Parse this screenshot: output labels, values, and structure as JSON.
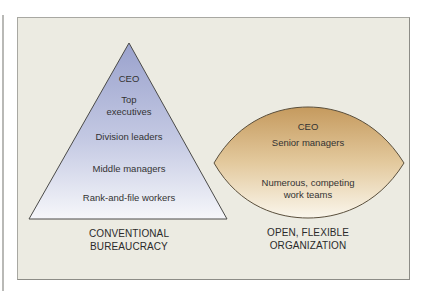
{
  "diagram": {
    "colors": {
      "panel_bg": "#ecebe2",
      "triangle_top": "#9ea6cf",
      "triangle_bottom": "#f4f5f8",
      "leaf_top": "#c9a26a",
      "leaf_bottom": "#f8f3e6",
      "outline": "#4a4a45"
    },
    "conventional": {
      "levels": [
        {
          "label": "CEO"
        },
        {
          "label": "Top\nexecutives"
        },
        {
          "label": "Division leaders"
        },
        {
          "label": "Middle managers"
        },
        {
          "label": "Rank-and-file workers"
        }
      ],
      "caption": "CONVENTIONAL\nBUREAUCRACY"
    },
    "flexible": {
      "levels": [
        {
          "label": "CEO"
        },
        {
          "label": "Senior managers"
        },
        {
          "label": "Numerous, competing\nwork teams"
        }
      ],
      "caption": "OPEN, FLEXIBLE\nORGANIZATION"
    }
  }
}
